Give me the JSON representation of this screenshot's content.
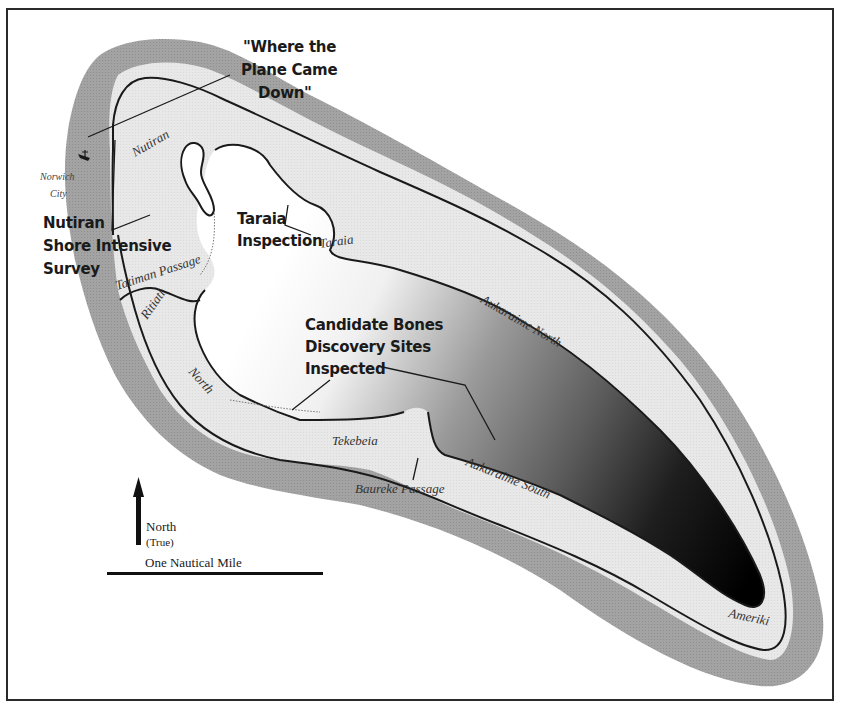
{
  "map": {
    "colors": {
      "reef": "#9c9c9c",
      "land": "#e6e6e6",
      "lagoon_light": "#ffffff",
      "lagoon_dark": "#000000",
      "ink": "#1a1a1a",
      "frame": "#2a2a2a"
    },
    "annotations": {
      "plane": {
        "line1": "\"Where the",
        "line2": "Plane Came",
        "line3": "Down\""
      },
      "nutiran_survey": {
        "line1": "Nutiran",
        "line2": "Shore Intensive",
        "line3": "Survey"
      },
      "taraia_inspection": {
        "line1": "Taraia",
        "line2": "Inspection"
      },
      "bones": {
        "line1": "Candidate Bones",
        "line2": "Discovery Sites",
        "line3": "Inspected"
      }
    },
    "place_names": {
      "norwich_city_1": "Norwich",
      "norwich_city_2": "City",
      "nutiran": "Nutiran",
      "taraia": "Taraia",
      "tatiman_passage": "Tatiman Passage",
      "ritiati": "Ritiati",
      "north": "North",
      "tekebeia": "Tekebeia",
      "baureke_passage": "Baureke Passage",
      "aukaraime_north": "Aukaraime North",
      "aukaraime_south": "Aukaraime South",
      "ameriki": "Ameriki"
    },
    "legend": {
      "north_label": "North",
      "north_sub": "(True)",
      "scale_label": "One Nautical Mile"
    },
    "icons": {
      "shipwreck": "shipwreck-icon",
      "north_arrow": "north-arrow-icon"
    }
  }
}
